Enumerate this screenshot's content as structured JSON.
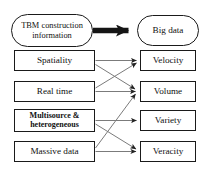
{
  "diagram": {
    "title_source": "TBM construction information",
    "title_target": "Big data",
    "source_node": {
      "id": "tbm-construction-information",
      "label_line1": "TBM construction",
      "label_line2": "information",
      "shape": "stadium"
    },
    "target_node": {
      "id": "big-data",
      "label": "Big data",
      "shape": "stadium"
    },
    "main_arrow": {
      "name": "thick-arrow",
      "from": "tbm-construction-information",
      "to": "big-data",
      "style": "thick-solid-black",
      "color": "#111111"
    },
    "left_column": [
      {
        "id": "spatiality",
        "label": "Spatiality",
        "lines": 1
      },
      {
        "id": "real-time",
        "label": "Real time",
        "lines": 1
      },
      {
        "id": "multisource-heterogeneous",
        "label_line1": "Multisource &",
        "label_line2": "heterogeneous",
        "lines": 2
      },
      {
        "id": "massive-data",
        "label": "Massive data",
        "lines": 1
      }
    ],
    "right_column": [
      {
        "id": "velocity",
        "label": "Velocity"
      },
      {
        "id": "volume",
        "label": "Volume"
      },
      {
        "id": "variety",
        "label": "Variety"
      },
      {
        "id": "veracity",
        "label": "Veracity"
      }
    ],
    "connections": [
      {
        "from": "spatiality",
        "to": "velocity",
        "kind": "horizontal"
      },
      {
        "from": "spatiality",
        "to": "volume",
        "kind": "diagonal-down"
      },
      {
        "from": "real-time",
        "to": "velocity",
        "kind": "diagonal-up"
      },
      {
        "from": "real-time",
        "to": "volume",
        "kind": "horizontal"
      },
      {
        "from": "multisource-heterogeneous",
        "to": "variety",
        "kind": "horizontal"
      },
      {
        "from": "multisource-heterogeneous",
        "to": "veracity",
        "kind": "diagonal-down"
      },
      {
        "from": "massive-data",
        "to": "volume",
        "kind": "diagonal-up"
      },
      {
        "from": "massive-data",
        "to": "veracity",
        "kind": "horizontal"
      }
    ],
    "colors": {
      "stroke": "#111111",
      "edge_line": "#777777",
      "background": "#ffffff"
    }
  }
}
